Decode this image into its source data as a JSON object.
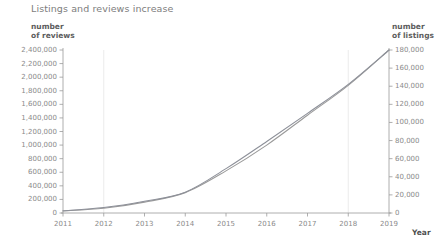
{
  "chart_data": {
    "type": "line",
    "title": "Listings and reviews increase",
    "xlabel": "Year",
    "ylabel": "number of reviews",
    "y2label": "number of listings",
    "grid": "vertical-faint",
    "legend": "none",
    "x": [
      2011,
      2012,
      2013,
      2014,
      2015,
      2016,
      2017,
      2018,
      2019
    ],
    "xlim": [
      2011,
      2019
    ],
    "ylim": [
      0,
      2400000
    ],
    "y2lim": [
      0,
      180000
    ],
    "xticks": [
      "2011",
      "2012",
      "2013",
      "2014",
      "2015",
      "2016",
      "2017",
      "2018",
      "2019"
    ],
    "yticks": [
      "0",
      "200,000",
      "400,000",
      "600,000",
      "800,000",
      "1,000,000",
      "1,200,000",
      "1,400,000",
      "1,600,000",
      "1,800,000",
      "2,000,000",
      "2,200,000",
      "2,400,000"
    ],
    "y2ticks": [
      "0",
      "20,000",
      "40,000",
      "60,000",
      "80,000",
      "100,000",
      "120,000",
      "140,000",
      "160,000",
      "180,000"
    ],
    "series": [
      {
        "name": "number of reviews",
        "axis": "left",
        "color": "#9a9a9a",
        "values": [
          30000,
          70000,
          160000,
          300000,
          620000,
          1000000,
          1440000,
          1880000,
          2400000
        ]
      },
      {
        "name": "number of listings",
        "axis": "right",
        "color": "#8d9099",
        "values": [
          2500,
          6000,
          13000,
          23000,
          49000,
          79000,
          110000,
          142000,
          180000
        ]
      }
    ]
  },
  "chart": {
    "title": "Listings and reviews increase",
    "left_axis_header_line1": "number",
    "left_axis_header_line2": "of reviews",
    "right_axis_header_line1": "number",
    "right_axis_header_line2": "of listings",
    "x_axis_title": "Year"
  }
}
